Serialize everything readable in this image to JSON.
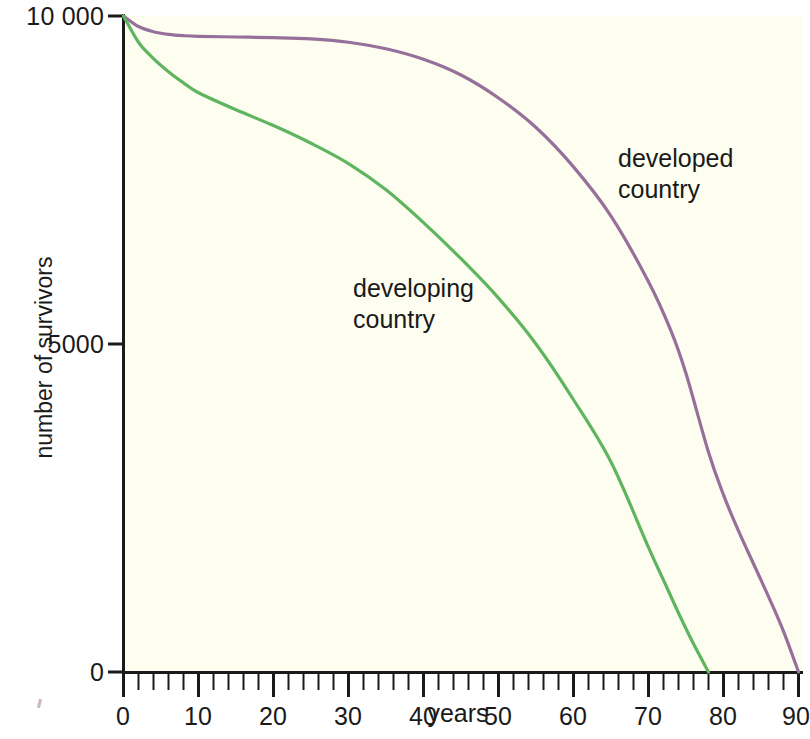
{
  "figure": {
    "background_color": "#ffffff",
    "plot_background_color": "#fdfdf0",
    "axis_color": "#1a1a1a"
  },
  "axes": {
    "y_title": "number of survivors",
    "x_title": "years",
    "y_tick_labels": [
      "10 000",
      "5000",
      "0"
    ],
    "x_tick_labels": [
      "0",
      "10",
      "20",
      "30",
      "40",
      "50",
      "60",
      "70",
      "80",
      "90"
    ]
  },
  "labels": {
    "developed_line1": "developed",
    "developed_line2": "country",
    "developing_line1": "developing",
    "developing_line2": "country"
  },
  "chart_data": {
    "type": "line",
    "title": "",
    "xlabel": "years",
    "ylabel": "number of survivors",
    "xlim": [
      0,
      90
    ],
    "ylim": [
      0,
      10000
    ],
    "xticks": [
      0,
      10,
      20,
      30,
      40,
      50,
      60,
      70,
      80,
      90
    ],
    "xminortick_interval": 2,
    "yticks": [
      0,
      5000,
      10000
    ],
    "grid": false,
    "legend": "inline-annotations",
    "series": [
      {
        "name": "developed country",
        "color": "#96709b",
        "label_position": "inline-right",
        "x": [
          0,
          2,
          4,
          6,
          8,
          10,
          15,
          20,
          25,
          30,
          35,
          40,
          45,
          50,
          55,
          60,
          65,
          70,
          73,
          75,
          78,
          80,
          82,
          84,
          86,
          88,
          90
        ],
        "y": [
          10000,
          9840,
          9760,
          9720,
          9700,
          9690,
          9680,
          9670,
          9650,
          9600,
          9500,
          9340,
          9100,
          8750,
          8300,
          7700,
          6950,
          5950,
          5200,
          4550,
          3350,
          2700,
          2150,
          1650,
          1150,
          620,
          0
        ]
      },
      {
        "name": "developing country",
        "color": "#5fb55f",
        "label_position": "inline-left",
        "x": [
          0,
          2,
          4,
          6,
          8,
          10,
          15,
          20,
          25,
          30,
          35,
          40,
          45,
          50,
          55,
          60,
          65,
          70,
          72,
          74,
          76,
          78
        ],
        "y": [
          10000,
          9600,
          9350,
          9150,
          8980,
          8830,
          8570,
          8330,
          8060,
          7750,
          7350,
          6850,
          6300,
          5700,
          5000,
          4150,
          3200,
          1900,
          1400,
          900,
          430,
          0
        ]
      }
    ]
  }
}
